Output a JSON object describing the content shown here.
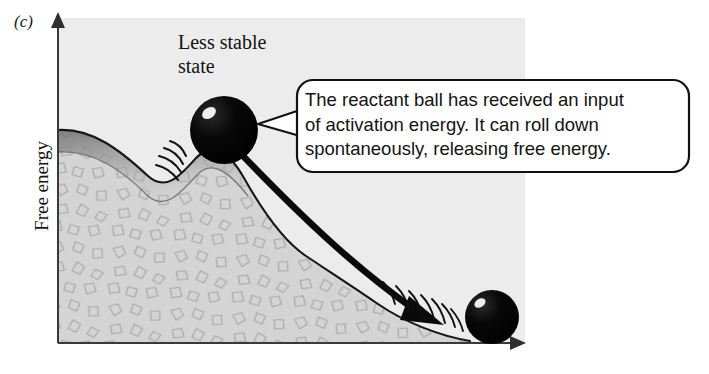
{
  "figure": {
    "panel_label": "(c)",
    "axes": {
      "y_label": "Free energy",
      "x_label": ""
    },
    "annotations": {
      "less_stable_state": "Less stable\nstate",
      "less_stable_line1": "Less stable",
      "less_stable_line2": "state"
    },
    "callout": {
      "line1": "The reactant ball has received an input",
      "line2": "of activation energy. It can roll down",
      "line3": "spontaneously, releasing free energy.",
      "full_text": "The reactant ball has received an input of activation energy. It can roll down spontaneously, releasing free energy."
    },
    "elements": {
      "reactant_ball_label": "reactant-ball",
      "product_ball_label": "product-ball",
      "terrain_label": "energy-landscape-hill",
      "arrow_label": "spontaneous-roll-arrow"
    },
    "colors": {
      "plot_background": "#ececec",
      "terrain_fill": "#d0d0d0",
      "terrain_stroke": "#1c1c1c",
      "ball_fill": "#000000",
      "ball_highlight": "#ffffff",
      "axis_stroke": "#3a3a3a",
      "callout_border": "#111111",
      "callout_fill": "#ffffff",
      "text_color": "#131313",
      "valley_shade": "#8d8d8d"
    }
  }
}
